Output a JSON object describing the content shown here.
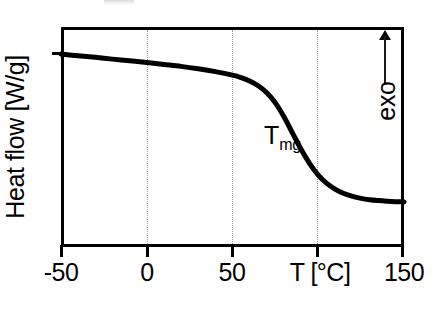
{
  "figure": {
    "background_color": "#ffffff",
    "frame_color": "#000000",
    "curve_color": "#000000",
    "gridline_color": "#9a9a9a",
    "annotation_color": "#1a1a1a"
  },
  "axes": {
    "y_title": "Heat flow [W/g]",
    "x_title": "T [°C]",
    "x_tick_labels": [
      "-50",
      "0",
      "50",
      "150"
    ]
  },
  "annotations": {
    "exo_label": "exo",
    "exo_arrow_icon": "arrow-up-icon",
    "tmg_symbol": "T",
    "tmg_subscript": "mg"
  },
  "chart_data": {
    "type": "line",
    "title": "",
    "subtitle": "",
    "xlabel": "T [°C]",
    "ylabel": "Heat flow [W/g]",
    "xlim": [
      -50,
      150
    ],
    "ylim": [
      0,
      1
    ],
    "x_ticks": [
      -50,
      0,
      50,
      100,
      150
    ],
    "x_tick_labels": [
      "-50",
      "0",
      "50",
      "T [°C]",
      "150"
    ],
    "y_ticks": [],
    "y_tick_labels": [],
    "grid": "vertical dotted gridlines at 0, 50 and 100 °C",
    "legend": "none",
    "y_axis_note": "arbitrary units; exothermic direction is up (exo arrow)",
    "annotations": [
      {
        "text": "T_mg",
        "label": "Tmg",
        "x": 90,
        "y": 0.46,
        "note": "midpoint glass transition temperature, marked on the inflection of the step"
      },
      {
        "text": "exo",
        "x": 146,
        "y": 0.82,
        "note": "upward arrow indicating exothermic direction"
      }
    ],
    "series": [
      {
        "name": "DSC heat flow",
        "x": [
          -50,
          -40,
          -30,
          -20,
          -10,
          0,
          10,
          20,
          30,
          40,
          50,
          55,
          60,
          65,
          70,
          75,
          80,
          85,
          90,
          95,
          100,
          105,
          110,
          115,
          120,
          125,
          130,
          135,
          140,
          145,
          150
        ],
        "y": [
          0.877,
          0.869,
          0.862,
          0.854,
          0.847,
          0.839,
          0.83,
          0.821,
          0.81,
          0.797,
          0.781,
          0.77,
          0.755,
          0.733,
          0.701,
          0.655,
          0.592,
          0.518,
          0.444,
          0.379,
          0.327,
          0.289,
          0.262,
          0.243,
          0.23,
          0.221,
          0.215,
          0.211,
          0.208,
          0.206,
          0.205
        ],
        "description": "Baseline with slight negative slope from -50 to ~50 °C, a sigmoidal endothermic step (glass transition) centred near 90 °C, then a lower, nearly flat baseline up to 150 °C"
      }
    ]
  }
}
